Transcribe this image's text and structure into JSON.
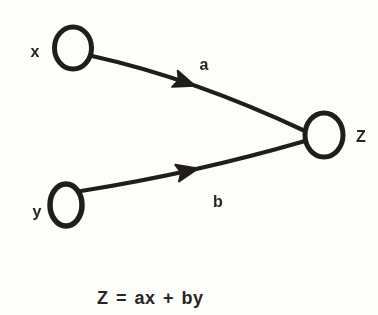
{
  "canvas": {
    "background": "#fdfdfc",
    "ink": "#211d19",
    "text_color": "#2a2522"
  },
  "diagram": {
    "type": "signal-flow-graph",
    "nodes": [
      {
        "id": "x",
        "label": "x"
      },
      {
        "id": "y",
        "label": "y"
      },
      {
        "id": "z",
        "label": "Z"
      }
    ],
    "edges": [
      {
        "from": "x",
        "to": "z",
        "label": "a"
      },
      {
        "from": "y",
        "to": "z",
        "label": "b"
      }
    ],
    "equation": "Z = ax + by"
  }
}
